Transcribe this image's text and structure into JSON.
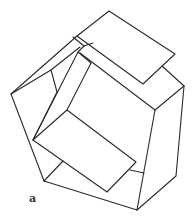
{
  "figure": {
    "label": "a",
    "stroke_color": "#2a2a2a"
  }
}
